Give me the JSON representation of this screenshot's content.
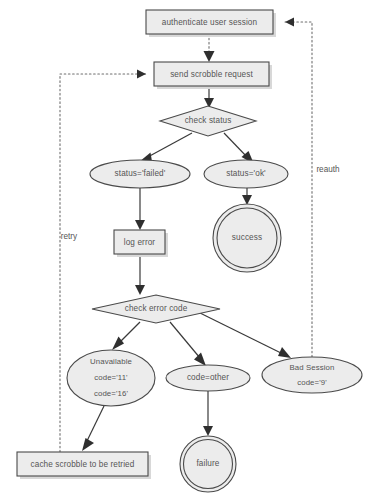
{
  "diagram": {
    "colors": {
      "shape_fill": "#ececec",
      "shape_stroke": "#4a4a4a",
      "box_shadow": "#d8d8d8",
      "solid_edge": "#3a3a3a",
      "dotted_edge": "#6e6e6e",
      "text": "#555555"
    },
    "nodes": [
      {
        "id": "authenticate",
        "type": "process-box",
        "label": "authenticate user session",
        "x": 146,
        "y": 10,
        "w": 127,
        "h": 24
      },
      {
        "id": "send-request",
        "type": "process-box",
        "label": "send scrobble request",
        "x": 154,
        "y": 62,
        "w": 115,
        "h": 24
      },
      {
        "id": "check-status",
        "type": "decision-diamond",
        "label": "check status",
        "cx": 208,
        "cy": 121,
        "rx": 48,
        "ry": 15
      },
      {
        "id": "status-failed",
        "type": "state-ellipse",
        "label": "status='failed'",
        "cx": 140,
        "cy": 174,
        "rx": 50,
        "ry": 14
      },
      {
        "id": "status-ok",
        "type": "state-ellipse",
        "label": "status='ok'",
        "cx": 246,
        "cy": 174,
        "rx": 42,
        "ry": 14
      },
      {
        "id": "success",
        "type": "end-double-circle",
        "label": "success",
        "cx": 247,
        "cy": 238,
        "r": 34
      },
      {
        "id": "log-error",
        "type": "process-box",
        "label": "log error",
        "x": 114,
        "y": 230,
        "w": 51,
        "h": 24
      },
      {
        "id": "check-error-code",
        "type": "decision-diamond",
        "label": "check error code",
        "cx": 156,
        "cy": 309,
        "rx": 64,
        "ry": 14
      },
      {
        "id": "unavailable",
        "type": "state-ellipse",
        "label_lines": [
          "Unavailable",
          "code='11'",
          "code='16'"
        ],
        "cx": 111,
        "cy": 378,
        "rx": 44,
        "ry": 28
      },
      {
        "id": "code-other",
        "type": "state-ellipse",
        "label": "code=other",
        "cx": 208,
        "cy": 378,
        "rx": 42,
        "ry": 13
      },
      {
        "id": "bad-session",
        "type": "state-ellipse",
        "label_lines": [
          "Bad Session",
          "code='9'"
        ],
        "cx": 312,
        "cy": 375,
        "rx": 50,
        "ry": 18
      },
      {
        "id": "cache-scrobble",
        "type": "process-box",
        "label": "cache scrobble to be retried",
        "x": 17,
        "y": 452,
        "w": 131,
        "h": 24
      },
      {
        "id": "failure",
        "type": "end-double-circle",
        "label": "failure",
        "cx": 208,
        "cy": 464,
        "r": 28
      }
    ],
    "edge_labels": [
      {
        "id": "retry-label",
        "text": "retry",
        "x": 60,
        "y": 237
      },
      {
        "id": "reauth-label",
        "text": "reauth",
        "x": 338,
        "y": 170
      }
    ],
    "edges": [
      {
        "id": "authenticate-to-send",
        "style": "dotted",
        "from": "authenticate",
        "to": "send-request"
      },
      {
        "id": "send-to-check-status",
        "style": "solid",
        "from": "send-request",
        "to": "check-status"
      },
      {
        "id": "check-status-to-failed",
        "style": "solid",
        "from": "check-status",
        "to": "status-failed"
      },
      {
        "id": "check-status-to-ok",
        "style": "solid",
        "from": "check-status",
        "to": "status-ok"
      },
      {
        "id": "ok-to-success",
        "style": "solid",
        "from": "status-ok",
        "to": "success"
      },
      {
        "id": "failed-to-log-error",
        "style": "solid",
        "from": "status-failed",
        "to": "log-error"
      },
      {
        "id": "log-error-to-check-code",
        "style": "solid",
        "from": "log-error",
        "to": "check-error-code"
      },
      {
        "id": "check-code-to-unavailable",
        "style": "solid",
        "from": "check-error-code",
        "to": "unavailable"
      },
      {
        "id": "check-code-to-other",
        "style": "solid",
        "from": "check-error-code",
        "to": "code-other"
      },
      {
        "id": "check-code-to-bad-session",
        "style": "solid",
        "from": "check-error-code",
        "to": "bad-session"
      },
      {
        "id": "unavailable-to-cache",
        "style": "solid",
        "from": "unavailable",
        "to": "cache-scrobble"
      },
      {
        "id": "other-to-failure",
        "style": "solid",
        "from": "code-other",
        "to": "failure"
      },
      {
        "id": "cache-to-send-retry",
        "style": "dotted",
        "from": "cache-scrobble",
        "to": "send-request",
        "label": "retry"
      },
      {
        "id": "bad-session-to-authenticate-reauth",
        "style": "dotted",
        "from": "bad-session",
        "to": "authenticate",
        "label": "reauth"
      }
    ]
  }
}
